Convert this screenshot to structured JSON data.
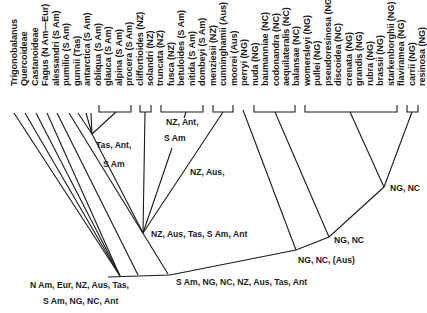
{
  "taxa": [
    "Trigonobalanus",
    "Quercoideae",
    "Castanoideae",
    "Fagus (N Am—Eur)",
    "alessandri (S Am)",
    "pumilio (S Am)",
    "gunnii (Tas)",
    "antarctica (S Am)",
    "obliqua (S Am)",
    "glauca (S Am)",
    "alpina (S Am)",
    "procera (S Am)",
    "cliffortioides (NZ)",
    "solandri (NZ)",
    "truncata (NZ)",
    "fusca (NZ)",
    "betuloides (S Am)",
    "nitida (S Am)",
    "dombeyi (S Am)",
    "menziesii (NZ)",
    "cunninghamii (Aus)",
    "moorei (Aus)",
    "perryi (NG)",
    "nuda (NG)",
    "baumanniae (NC)",
    "codonandra (NC)",
    "aequilateralis (NC)",
    "balansae (NC)",
    "womersleyi (NG)",
    "pullei (NG)",
    "pseudoresinosa (NG)",
    "discoidea (NC)",
    "crenata (NG)",
    "grandis (NG)",
    "rubra (NG)",
    "brassii (NG)",
    "starkenborghii (NG)",
    "flaviramea (NG)",
    "carrii (NG)",
    "resinosa (NG)"
  ],
  "annotations": {
    "root_line1": "N Am, Eur, NZ, Aus, Tas,",
    "root_line2": "S Am, NG, NC, Ant",
    "nothofagus_root": "S Am, NG, NC, NZ, Aus, Tas, Ant",
    "southern_clade": "NZ, Aus, Tas, S Am, Ant",
    "subgroup_tas_line1": "Tas, Ant,",
    "subgroup_tas_line2": "S Am",
    "subgroup_nz_line1": "NZ, Ant,",
    "subgroup_nz_line2": "S Am",
    "subgroup_nz_aus": "NZ, Aus,",
    "brassospora_root": "NG, NC, (Aus)",
    "brassospora_inner": "NG, NC",
    "brassospora_top": "NG, NC"
  }
}
